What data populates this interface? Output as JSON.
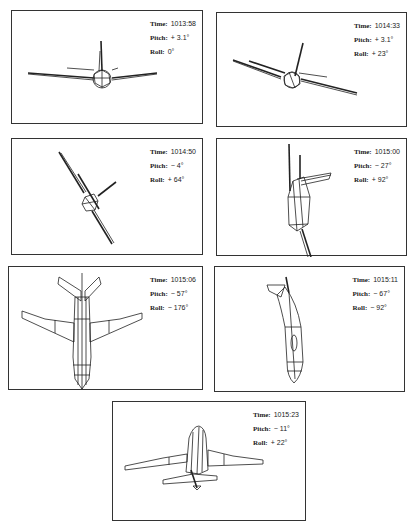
{
  "figure": {
    "panels": [
      {
        "id": "p1",
        "time_label": "Time:",
        "time": "1013:58",
        "pitch_label": "Pitch:",
        "pitch": "+ 3.1°",
        "roll_label": "Roll:",
        "roll": "0°",
        "view": "rear-level"
      },
      {
        "id": "p2",
        "time_label": "Time:",
        "time": "1014:33",
        "pitch_label": "Pitch:",
        "pitch": "+ 3.1°",
        "roll_label": "Roll:",
        "roll": "+ 23°",
        "view": "rear-banked"
      },
      {
        "id": "p3",
        "time_label": "Time:",
        "time": "1014:50",
        "pitch_label": "Pitch:",
        "pitch": "− 4°",
        "roll_label": "Roll:",
        "roll": "+ 64°",
        "view": "rear-steep-bank"
      },
      {
        "id": "p4",
        "time_label": "Time:",
        "time": "1015:00",
        "pitch_label": "Pitch:",
        "pitch": "− 27°",
        "roll_label": "Roll:",
        "roll": "+ 92°",
        "view": "knife-edge"
      },
      {
        "id": "p5",
        "time_label": "Time:",
        "time": "1015:06",
        "pitch_label": "Pitch:",
        "pitch": "− 57°",
        "roll_label": "Roll:",
        "roll": "− 176°",
        "view": "plan-inverted-dive"
      },
      {
        "id": "p6",
        "time_label": "Time:",
        "time": "1015:11",
        "pitch_label": "Pitch:",
        "pitch": "− 67°",
        "roll_label": "Roll:",
        "roll": "− 92°",
        "view": "side-steep-dive"
      },
      {
        "id": "p7",
        "time_label": "Time:",
        "time": "1015:23",
        "pitch_label": "Pitch:",
        "pitch": "− 11°",
        "roll_label": "Roll:",
        "roll": "+ 22°",
        "view": "front-banked-recovery"
      }
    ]
  }
}
